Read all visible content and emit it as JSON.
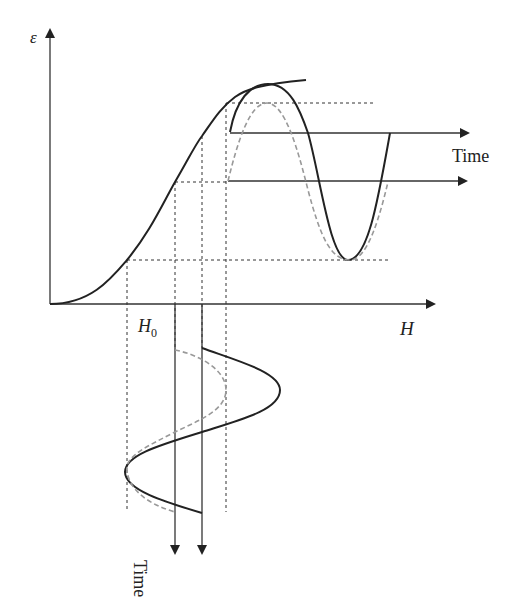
{
  "diagram": {
    "labels": {
      "y_axis": "ε",
      "x_axis": "H",
      "bias_field": "H",
      "bias_sub": "0",
      "time_right": "Time",
      "time_bottom": "Time"
    },
    "colors": {
      "solid": "#222222",
      "dashed": "#999999",
      "dotted": "#333333"
    }
  }
}
